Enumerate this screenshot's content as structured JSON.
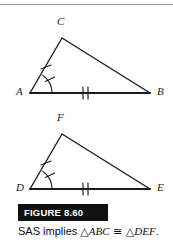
{
  "figure": {
    "badge_label": "FIGURE 8.60",
    "caption_prefix": "SAS implies ",
    "caption_triangle_1": "△ABC",
    "caption_congruent_symbol": "≅",
    "caption_triangle_2": "△DEF",
    "caption_suffix": ".",
    "caption_full": "SAS implies △ABC ≅ △DEF.",
    "stroke_color": "#1b1b1b",
    "badge_background": "#111111",
    "badge_text_color": "#ffffff",
    "rule_color": "#9a9a9a"
  },
  "triangles": [
    {
      "name": "triangle-abc",
      "vertices": [
        {
          "label": "A",
          "x": 30,
          "y": 93,
          "label_x": 16,
          "label_y": 86
        },
        {
          "label": "B",
          "x": 150,
          "y": 93,
          "label_x": 157,
          "label_y": 86
        },
        {
          "label": "C",
          "x": 62,
          "y": 38,
          "label_x": 57,
          "label_y": 16
        }
      ],
      "marks": {
        "single_tick_side": "AC",
        "double_tick_side": "AB",
        "angle_arc_vertex": "A",
        "angle_arc_tick": true
      }
    },
    {
      "name": "triangle-def",
      "vertices": [
        {
          "label": "D",
          "x": 30,
          "y": 189,
          "label_x": 16,
          "label_y": 182
        },
        {
          "label": "E",
          "x": 150,
          "y": 189,
          "label_x": 157,
          "label_y": 182
        },
        {
          "label": "F",
          "x": 62,
          "y": 134,
          "label_x": 57,
          "label_y": 112
        }
      ],
      "marks": {
        "single_tick_side": "DF",
        "double_tick_side": "DE",
        "angle_arc_vertex": "D",
        "angle_arc_tick": true
      }
    }
  ]
}
